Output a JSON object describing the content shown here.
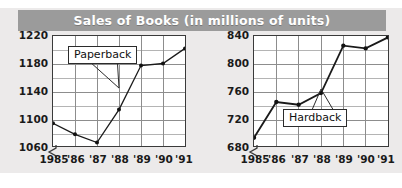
{
  "title": "Sales of Books (in millions of units)",
  "colors": {
    "banner": "#9b9b9b",
    "banner_text": "#ffffff",
    "page_bg": "#eceaea",
    "plot_bg": "#ffffff",
    "axis": "#3a3a3a",
    "grid_major": "#8d8d8d",
    "grid_minor": "#b4b4b4",
    "series": "#1a1a1a"
  },
  "chart_data": [
    {
      "type": "line",
      "title": "Sales of Books (in millions of units)",
      "series_name": "Paperback",
      "annotation": "Paperback",
      "xlabel": "",
      "ylabel": "",
      "categories": [
        "1985",
        "'86",
        "'87",
        "'88",
        "'89",
        "'90",
        "'91"
      ],
      "x": [
        1985,
        1986,
        1987,
        1988,
        1989,
        1990,
        1991
      ],
      "values": [
        1093,
        1077,
        1065,
        1113,
        1177,
        1180,
        1202
      ],
      "ylim": [
        1060,
        1220
      ],
      "yticks": [
        1060,
        1100,
        1140,
        1180,
        1220
      ],
      "ytick_labels": [
        "1060",
        "1100",
        "1140",
        "1180",
        "1220"
      ],
      "minor_y_step": 20,
      "grid": true,
      "axis_break": true,
      "legend": "none",
      "markers": true
    },
    {
      "type": "line",
      "title": "Sales of Books (in millions of units)",
      "series_name": "Hardback",
      "annotation": "Hardback",
      "xlabel": "",
      "ylabel": "",
      "categories": [
        "1985",
        "'86",
        "'87",
        "'88",
        "'89",
        "'90",
        "'91"
      ],
      "x": [
        1985,
        1986,
        1987,
        1988,
        1989,
        1990,
        1991
      ],
      "values": [
        692,
        744,
        740,
        757,
        826,
        822,
        838
      ],
      "ylim": [
        680,
        840
      ],
      "yticks": [
        680,
        720,
        760,
        800,
        840
      ],
      "ytick_labels": [
        "680",
        "720",
        "760",
        "800",
        "840"
      ],
      "minor_y_step": 20,
      "grid": true,
      "axis_break": true,
      "legend": "none",
      "markers": true
    }
  ]
}
